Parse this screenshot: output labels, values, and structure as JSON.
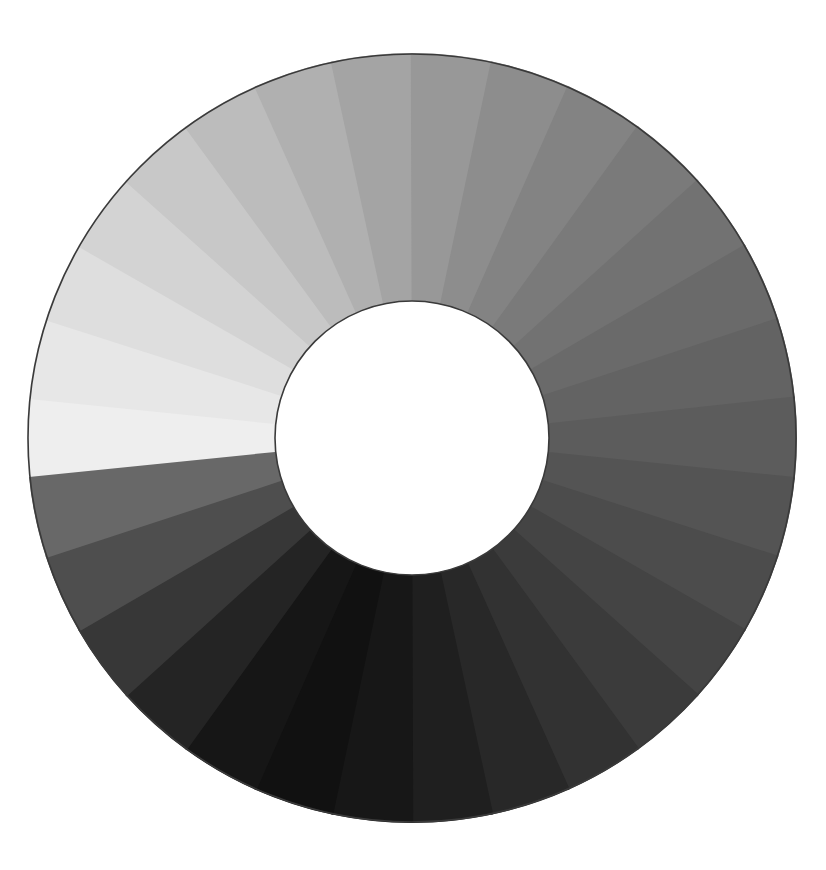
{
  "figure": {
    "type": "annulus-color-wheel",
    "background_color": "#ffffff",
    "canvas": {
      "width": 826,
      "height": 870
    }
  },
  "chart_data": {
    "type": "pie",
    "subtitle": "",
    "xlabel": "",
    "ylabel": "",
    "legend_position": "none",
    "grid": false,
    "variant": "donut",
    "geometry": {
      "center_x": 412,
      "center_y": 438,
      "outer_radius": 384,
      "inner_radius": 137,
      "segment_count": 30,
      "segment_angle_deg": 12,
      "start_angle_deg": -90,
      "hub_color": "#ffffff",
      "outline_color": "#3a3a3a",
      "outline_width": 1.6
    },
    "categories": [
      "0",
      "1",
      "2",
      "3",
      "4",
      "5",
      "6",
      "7",
      "8",
      "9",
      "10",
      "11",
      "12",
      "13",
      "14",
      "15",
      "16",
      "17",
      "18",
      "19",
      "20",
      "21",
      "22",
      "23",
      "24",
      "25",
      "26",
      "27",
      "28",
      "29"
    ],
    "values": [
      12,
      12,
      12,
      12,
      12,
      12,
      12,
      12,
      12,
      12,
      12,
      12,
      12,
      12,
      12,
      12,
      12,
      12,
      12,
      12,
      12,
      12,
      12,
      12,
      12,
      12,
      12,
      12,
      12,
      12
    ],
    "series": [
      {
        "name": "Gray level (0-255)",
        "values": [
          238,
          231,
          222,
          211,
          200,
          188,
          176,
          164,
          152,
          141,
          131,
          122,
          114,
          106,
          99,
          92,
          84,
          76,
          68,
          59,
          50,
          40,
          31,
          23,
          17,
          22,
          36,
          55,
          78,
          104
        ]
      }
    ],
    "ylim": [
      0,
      255
    ],
    "annotations": [],
    "segments": [
      {
        "index": 0,
        "label": "0",
        "start_deg": -96,
        "end_deg": -84,
        "gray": 238,
        "color": "#eeeeee"
      },
      {
        "index": 1,
        "label": "1",
        "start_deg": -84,
        "end_deg": -72,
        "gray": 231,
        "color": "#e7e7e7"
      },
      {
        "index": 2,
        "label": "2",
        "start_deg": -72,
        "end_deg": -60,
        "gray": 222,
        "color": "#dedede"
      },
      {
        "index": 3,
        "label": "3",
        "start_deg": -60,
        "end_deg": -48,
        "gray": 211,
        "color": "#d3d3d3"
      },
      {
        "index": 4,
        "label": "4",
        "start_deg": -48,
        "end_deg": -36,
        "gray": 200,
        "color": "#c8c8c8"
      },
      {
        "index": 5,
        "label": "5",
        "start_deg": -36,
        "end_deg": -24,
        "gray": 188,
        "color": "#bcbcbc"
      },
      {
        "index": 6,
        "label": "6",
        "start_deg": -24,
        "end_deg": -12,
        "gray": 176,
        "color": "#b0b0b0"
      },
      {
        "index": 7,
        "label": "7",
        "start_deg": -12,
        "end_deg": 0,
        "gray": 164,
        "color": "#a4a4a4"
      },
      {
        "index": 8,
        "label": "8",
        "start_deg": 0,
        "end_deg": 12,
        "gray": 152,
        "color": "#989898"
      },
      {
        "index": 9,
        "label": "9",
        "start_deg": 12,
        "end_deg": 24,
        "gray": 141,
        "color": "#8d8d8d"
      },
      {
        "index": 10,
        "label": "10",
        "start_deg": 24,
        "end_deg": 36,
        "gray": 131,
        "color": "#838383"
      },
      {
        "index": 11,
        "label": "11",
        "start_deg": 36,
        "end_deg": 48,
        "gray": 122,
        "color": "#7a7a7a"
      },
      {
        "index": 12,
        "label": "12",
        "start_deg": 48,
        "end_deg": 60,
        "gray": 114,
        "color": "#727272"
      },
      {
        "index": 13,
        "label": "13",
        "start_deg": 60,
        "end_deg": 72,
        "gray": 106,
        "color": "#6a6a6a"
      },
      {
        "index": 14,
        "label": "14",
        "start_deg": 72,
        "end_deg": 84,
        "gray": 99,
        "color": "#636363"
      },
      {
        "index": 15,
        "label": "15",
        "start_deg": 84,
        "end_deg": 96,
        "gray": 92,
        "color": "#5c5c5c"
      },
      {
        "index": 16,
        "label": "16",
        "start_deg": 96,
        "end_deg": 108,
        "gray": 84,
        "color": "#545454"
      },
      {
        "index": 17,
        "label": "17",
        "start_deg": 108,
        "end_deg": 120,
        "gray": 76,
        "color": "#4c4c4c"
      },
      {
        "index": 18,
        "label": "18",
        "start_deg": 120,
        "end_deg": 132,
        "gray": 68,
        "color": "#444444"
      },
      {
        "index": 19,
        "label": "19",
        "start_deg": 132,
        "end_deg": 144,
        "gray": 59,
        "color": "#3b3b3b"
      },
      {
        "index": 20,
        "label": "20",
        "start_deg": 144,
        "end_deg": 156,
        "gray": 50,
        "color": "#323232"
      },
      {
        "index": 21,
        "label": "21",
        "start_deg": 156,
        "end_deg": 168,
        "gray": 40,
        "color": "#282828"
      },
      {
        "index": 22,
        "label": "22",
        "start_deg": 168,
        "end_deg": 180,
        "gray": 31,
        "color": "#1f1f1f"
      },
      {
        "index": 23,
        "label": "23",
        "start_deg": 180,
        "end_deg": 192,
        "gray": 23,
        "color": "#171717"
      },
      {
        "index": 24,
        "label": "24",
        "start_deg": 192,
        "end_deg": 204,
        "gray": 17,
        "color": "#111111"
      },
      {
        "index": 25,
        "label": "25",
        "start_deg": 204,
        "end_deg": 216,
        "gray": 22,
        "color": "#161616"
      },
      {
        "index": 26,
        "label": "26",
        "start_deg": 216,
        "end_deg": 228,
        "gray": 36,
        "color": "#242424"
      },
      {
        "index": 27,
        "label": "27",
        "start_deg": 228,
        "end_deg": 240,
        "gray": 55,
        "color": "#373737"
      },
      {
        "index": 28,
        "label": "28",
        "start_deg": 240,
        "end_deg": 252,
        "gray": 78,
        "color": "#4e4e4e"
      },
      {
        "index": 29,
        "label": "29",
        "start_deg": 252,
        "end_deg": 264,
        "gray": 104,
        "color": "#686868"
      }
    ]
  }
}
